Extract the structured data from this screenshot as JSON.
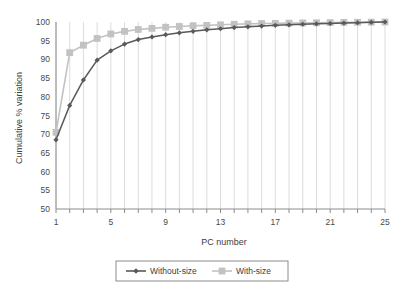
{
  "chart_data": {
    "type": "line",
    "title": "",
    "xlabel": "PC number",
    "ylabel": "Cumulative % variation",
    "xlim": [
      1,
      25
    ],
    "ylim": [
      50,
      100
    ],
    "xticks": [
      1,
      5,
      9,
      13,
      17,
      21,
      25
    ],
    "yticks": [
      50,
      55,
      60,
      65,
      70,
      75,
      80,
      85,
      90,
      95,
      100
    ],
    "grid": "vertical-only",
    "legend_position": "bottom",
    "x": [
      1,
      2,
      3,
      4,
      5,
      6,
      7,
      8,
      9,
      10,
      11,
      12,
      13,
      14,
      15,
      16,
      17,
      18,
      19,
      20,
      21,
      22,
      23,
      24,
      25
    ],
    "series": [
      {
        "name": "Without-size",
        "color": "#595959",
        "marker": "diamond",
        "values": [
          68.5,
          77.7,
          84.5,
          89.8,
          92.3,
          94.1,
          95.3,
          96.0,
          96.6,
          97.1,
          97.5,
          97.9,
          98.2,
          98.5,
          98.7,
          98.9,
          99.1,
          99.25,
          99.4,
          99.5,
          99.6,
          99.7,
          99.8,
          99.9,
          100.0
        ]
      },
      {
        "name": "With-size",
        "color": "#c2c2c2",
        "marker": "square",
        "values": [
          70.5,
          91.8,
          93.8,
          95.6,
          96.8,
          97.5,
          98.0,
          98.3,
          98.6,
          98.8,
          99.0,
          99.1,
          99.25,
          99.4,
          99.5,
          99.6,
          99.65,
          99.7,
          99.75,
          99.8,
          99.85,
          99.9,
          99.93,
          99.96,
          100.0
        ]
      }
    ]
  },
  "legend": {
    "entries": [
      {
        "label": "Without-size"
      },
      {
        "label": "With-size"
      }
    ]
  },
  "axis": {
    "x_title": "PC number",
    "y_title": "Cumulative % variation"
  },
  "colors": {
    "series_dark": "#595959",
    "series_light": "#c2c2c2",
    "gridline": "#dcdcdc",
    "axis": "#8c8c8c",
    "text": "#3d3d3d"
  }
}
